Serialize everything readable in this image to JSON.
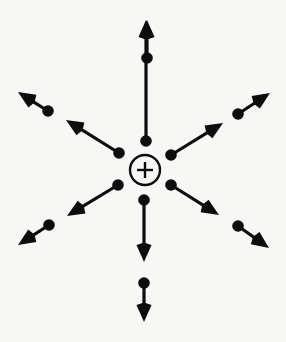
{
  "figure": {
    "title": "Electric field of a positive point charge",
    "background_color": "#f7f7f6",
    "ink_color": "#0d0d0d",
    "width": 286,
    "height": 342
  },
  "charge": {
    "label": "+",
    "polarity": "positive",
    "center_x": 145,
    "center_y": 170,
    "radius": 15,
    "ring_stroke_width": 2.4,
    "plus_arm": 8,
    "plus_stroke_width": 2.4
  },
  "style": {
    "dot_radius": 5.8,
    "shaft_width": 3.2,
    "head_length": 17,
    "head_halfwidth": 7.5
  },
  "vectors": [
    {
      "name": "north-inner",
      "direction": "up",
      "ring": "inner",
      "dot_x": 146,
      "dot_y": 141,
      "tip_x": 146,
      "tip_y": 20
    },
    {
      "name": "north-outer",
      "direction": "up",
      "ring": "outer",
      "dot_x": 147,
      "dot_y": 58,
      "tip_x": 147,
      "tip_y": 20
    },
    {
      "name": "south-inner",
      "direction": "down",
      "ring": "inner",
      "dot_x": 144,
      "dot_y": 200,
      "tip_x": 144,
      "tip_y": 262
    },
    {
      "name": "south-outer",
      "direction": "down",
      "ring": "outer",
      "dot_x": 144,
      "dot_y": 283,
      "tip_x": 144,
      "tip_y": 322
    },
    {
      "name": "northwest-inner",
      "direction": "up-left",
      "ring": "inner",
      "dot_x": 119,
      "dot_y": 153,
      "tip_x": 66,
      "tip_y": 120
    },
    {
      "name": "northwest-outer",
      "direction": "up-left",
      "ring": "outer",
      "dot_x": 48,
      "dot_y": 111,
      "tip_x": 18,
      "tip_y": 92
    },
    {
      "name": "northeast-inner",
      "direction": "up-right",
      "ring": "inner",
      "dot_x": 171,
      "dot_y": 155,
      "tip_x": 223,
      "tip_y": 123
    },
    {
      "name": "northeast-outer",
      "direction": "up-right",
      "ring": "outer",
      "dot_x": 238,
      "dot_y": 114,
      "tip_x": 270,
      "tip_y": 93
    },
    {
      "name": "southwest-inner",
      "direction": "down-left",
      "ring": "inner",
      "dot_x": 118,
      "dot_y": 185,
      "tip_x": 67,
      "tip_y": 216
    },
    {
      "name": "southwest-outer",
      "direction": "down-left",
      "ring": "outer",
      "dot_x": 49,
      "dot_y": 225,
      "tip_x": 18,
      "tip_y": 245
    },
    {
      "name": "southeast-inner",
      "direction": "down-right",
      "ring": "inner",
      "dot_x": 171,
      "dot_y": 185,
      "tip_x": 219,
      "tip_y": 215
    },
    {
      "name": "southeast-outer",
      "direction": "down-right",
      "ring": "outer",
      "dot_x": 238,
      "dot_y": 226,
      "tip_x": 269,
      "tip_y": 248
    }
  ]
}
